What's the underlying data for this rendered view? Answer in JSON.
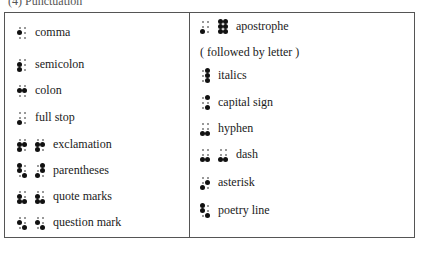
{
  "heading": "(4) Punctuation",
  "left": [
    {
      "label": "comma",
      "top": 12,
      "cells": [
        [
          0,
          1,
          0,
          0,
          0,
          0
        ]
      ]
    },
    {
      "label": "semicolon",
      "top": 44,
      "cells": [
        [
          0,
          1,
          1,
          0,
          0,
          0
        ]
      ]
    },
    {
      "label": "colon",
      "top": 70,
      "cells": [
        [
          0,
          1,
          0,
          0,
          1,
          0
        ]
      ]
    },
    {
      "label": "full stop",
      "top": 97,
      "cells": [
        [
          0,
          0,
          1,
          0,
          0,
          0
        ]
      ]
    },
    {
      "label": "exclamation",
      "top": 124,
      "cells": [
        [
          0,
          1,
          1,
          0,
          1,
          0
        ],
        [
          0,
          1,
          1,
          0,
          1,
          0
        ]
      ]
    },
    {
      "label": "parentheses",
      "top": 150,
      "cells": [
        [
          1,
          1,
          0,
          0,
          0,
          1
        ],
        [
          0,
          0,
          1,
          1,
          1,
          0
        ]
      ]
    },
    {
      "label": "quote marks",
      "top": 176,
      "cells": [
        [
          0,
          1,
          1,
          0,
          0,
          1
        ],
        [
          0,
          1,
          1,
          0,
          0,
          1
        ]
      ]
    },
    {
      "label": "question mark",
      "top": 202,
      "cells": [
        [
          0,
          1,
          0,
          0,
          0,
          1
        ],
        [
          0,
          1,
          0,
          0,
          0,
          1
        ]
      ]
    }
  ],
  "right": [
    {
      "label": "apostrophe",
      "top": 6,
      "cells": [
        [
          0,
          0,
          1,
          0,
          0,
          0
        ],
        [
          1,
          1,
          1,
          1,
          1,
          1
        ]
      ]
    },
    {
      "note": "( followed by letter )",
      "top": 32
    },
    {
      "label": "italics",
      "top": 55,
      "cells": [
        [
          0,
          0,
          0,
          1,
          1,
          1
        ]
      ]
    },
    {
      "label": "capital sign",
      "top": 82,
      "cells": [
        [
          0,
          0,
          0,
          1,
          0,
          1
        ]
      ]
    },
    {
      "label": "hyphen",
      "top": 108,
      "cells": [
        [
          0,
          0,
          1,
          0,
          0,
          1
        ]
      ]
    },
    {
      "label": "dash",
      "top": 134,
      "cells": [
        [
          0,
          0,
          1,
          0,
          0,
          1
        ],
        [
          0,
          0,
          1,
          0,
          0,
          1
        ]
      ]
    },
    {
      "label": "asterisk",
      "top": 162,
      "cells": [
        [
          0,
          0,
          1,
          0,
          1,
          0
        ]
      ]
    },
    {
      "label": "poetry line",
      "top": 190,
      "cells": [
        [
          1,
          1,
          0,
          0,
          0,
          1
        ]
      ]
    }
  ]
}
